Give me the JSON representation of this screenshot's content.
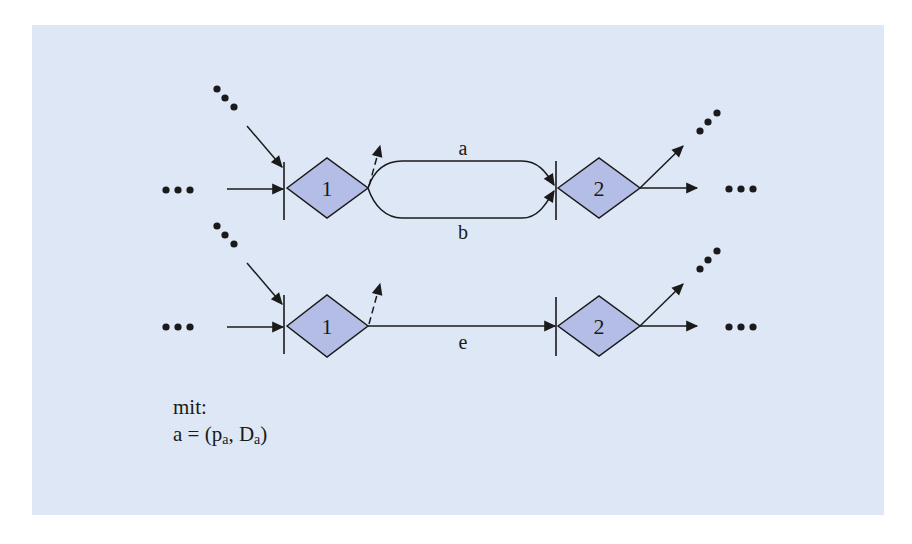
{
  "colors": {
    "panel_background": "#dde7f5",
    "node_fill": "#b4bde6",
    "stroke": "#1a1a1a"
  },
  "diagram": {
    "top_row": {
      "node_left": {
        "label": "1"
      },
      "node_right": {
        "label": "2"
      },
      "edges": [
        {
          "label": "a",
          "from": "1",
          "to": "2",
          "path": "upper"
        },
        {
          "label": "b",
          "from": "1",
          "to": "2",
          "path": "lower"
        }
      ]
    },
    "bottom_row": {
      "node_left": {
        "label": "1"
      },
      "node_right": {
        "label": "2"
      },
      "edges": [
        {
          "label": "e",
          "from": "1",
          "to": "2",
          "path": "straight"
        }
      ]
    },
    "ellipsis": "•••"
  },
  "caption": {
    "line1": "mit:",
    "line2_prefix": "a = (p",
    "line2_sub1": "a",
    "line2_mid": ", D",
    "line2_sub2": "a",
    "line2_suffix": ")"
  }
}
